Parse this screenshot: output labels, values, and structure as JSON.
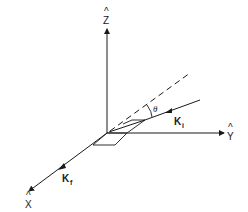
{
  "diagram": {
    "type": "3d-coordinate-scattering-geometry",
    "axes": {
      "z": {
        "label": "Z",
        "hat": "^"
      },
      "y": {
        "label": "Y",
        "hat": "^"
      },
      "x": {
        "label": "X",
        "hat": "^"
      }
    },
    "vectors": {
      "incident": {
        "label": "K",
        "subscript": "i"
      },
      "final": {
        "label": "K",
        "subscript": "f"
      }
    },
    "angle": {
      "label": "θ"
    },
    "colors": {
      "stroke": "#1a1a1a",
      "background": "#ffffff"
    }
  }
}
